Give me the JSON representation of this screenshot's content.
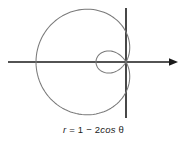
{
  "figure": {
    "name": "polar-limacon-plot",
    "background_color": "#ffffff",
    "caption": {
      "full_text": "r = 1 − 2cos θ",
      "variable": "r",
      "equals": "=",
      "constant": "1",
      "minus": "−",
      "coefficient": "2",
      "function": "cos",
      "angle": "θ"
    },
    "axes": {
      "horizontal_label": "",
      "vertical_label": "",
      "origin_x": 126,
      "origin_y": 62,
      "axis_color": "#1a1a1a",
      "horizontal_start_x": 8,
      "horizontal_end_x": 178,
      "vertical_start_y": 8,
      "vertical_end_y": 118,
      "horizontal_arrow": "arrow-right",
      "vertical_arrow": "none"
    },
    "curve": {
      "color": "#7a7a7a",
      "stroke_width": 1.05,
      "description": "limacon with inner loop"
    }
  },
  "chart_data": {
    "type": "line",
    "plot_kind": "polar",
    "title": "",
    "subtitle": "",
    "xlabel": "",
    "ylabel": "",
    "grid": false,
    "legend_position": "none",
    "annotations": [
      "r = 1 − 2cos θ"
    ],
    "equation": "r = 1 - 2*cos(theta)",
    "curve_name": "limacon with inner loop",
    "a": 1,
    "b": -2,
    "theta_range_deg": [
      0,
      360
    ],
    "theta_step_deg": 2,
    "pixels_per_unit": 30.0,
    "origin_px": [
      126,
      62
    ],
    "features": {
      "max_r": 3,
      "min_r": -1,
      "inner_loop_theta_deg": [
        -60,
        60
      ],
      "pole_crossings_theta_deg": [
        60,
        300
      ],
      "x_extent_units": [
        -3.0,
        0.27
      ],
      "y_extent_units": [
        -1.3,
        1.3
      ]
    },
    "theta_deg": [
      0,
      10,
      20,
      30,
      40,
      50,
      60,
      70,
      80,
      90,
      100,
      110,
      120,
      130,
      140,
      150,
      160,
      170,
      180,
      190,
      200,
      210,
      220,
      230,
      240,
      250,
      260,
      270,
      280,
      290,
      300,
      310,
      320,
      330,
      340,
      350,
      360
    ],
    "r_values": [
      -1.0,
      -0.97,
      -0.879,
      -0.732,
      -0.532,
      -0.286,
      0.0,
      0.316,
      0.653,
      1.0,
      1.347,
      1.684,
      2.0,
      2.286,
      2.532,
      2.732,
      2.879,
      2.97,
      3.0,
      2.97,
      2.879,
      2.732,
      2.532,
      2.286,
      2.0,
      1.684,
      1.347,
      1.0,
      0.653,
      0.316,
      0.0,
      -0.286,
      -0.532,
      -0.732,
      -0.879,
      -0.97,
      -1.0
    ]
  }
}
